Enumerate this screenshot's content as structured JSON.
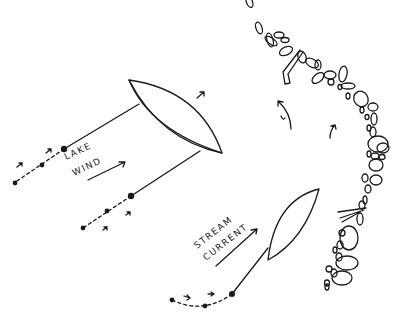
{
  "diagram": {
    "labels": {
      "lake_wind_line1": "LAKE",
      "lake_wind_line2": "WIND",
      "stream_current_line1": "STREAM",
      "stream_current_line2": "CURRENT"
    },
    "elements": [
      "kite-lake (lens shape, upper left)",
      "tether lines to two dashed bead paths",
      "kite-stream (lens shape, lower middle)",
      "rocky shoreline (boulders along right edge)",
      "flow arrows and eddy arrow"
    ],
    "colors": {
      "ink": "#1a1a1a",
      "background": "#ffffff"
    }
  }
}
